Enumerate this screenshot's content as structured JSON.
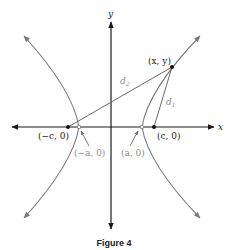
{
  "figure": {
    "caption": "Figure 4",
    "colors": {
      "axis": "#1a1a1a",
      "curve": "#7a7a7a",
      "segment": "#6a6a6a",
      "point": "#111111",
      "gray_label": "#8a8a8a"
    },
    "axes": {
      "x_label": "x",
      "y_label": "y"
    },
    "points": {
      "general_point": "(x, y)",
      "left_focus": "(−c, 0)",
      "right_focus": "(c, 0)",
      "left_vertex": "(−a, 0)",
      "right_vertex": "(a, 0)"
    },
    "distances": {
      "d1_label": "d",
      "d1_sub": "1",
      "d2_label": "d",
      "d2_sub": "2"
    }
  }
}
